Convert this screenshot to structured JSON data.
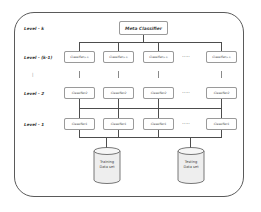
{
  "diagram": {
    "levels": [
      {
        "label": "Level - k"
      },
      {
        "label": "Level - (k-1)"
      },
      {
        "label": "|"
      },
      {
        "label": "Level - 2"
      },
      {
        "label": "Level - 1"
      }
    ],
    "meta_classifier": {
      "label": "Meta Classifier"
    },
    "row_k_minus_1": {
      "items": [
        {
          "label": "Classifier",
          "sup": "(k-1)"
        },
        {
          "label": "Classifier",
          "sup": "(k-1)"
        },
        {
          "label": "Classifier",
          "sup": "(k-1)"
        },
        {
          "label": "Classifier",
          "sup": "(k-1)"
        }
      ],
      "ellipsis": "....."
    },
    "row_2": {
      "items": [
        {
          "label": "Classifier2"
        },
        {
          "label": "Classifier2"
        },
        {
          "label": "Classifier2"
        },
        {
          "label": "Classifier2"
        }
      ],
      "ellipsis": "....."
    },
    "row_1": {
      "items": [
        {
          "label": "Classifier1"
        },
        {
          "label": "Classifier1"
        },
        {
          "label": "Classifier1"
        },
        {
          "label": "Classifier1"
        }
      ],
      "ellipsis": "....."
    },
    "datasets": [
      {
        "line1": "Training",
        "line2": "Data set"
      },
      {
        "line1": "Testing",
        "line2": "Data set"
      }
    ],
    "colors": {
      "frame": "#5a5a5a",
      "lines": "#4d4d4d",
      "box_border": "#9a9a9a",
      "cylinder_fill": "#eeeeee"
    }
  }
}
